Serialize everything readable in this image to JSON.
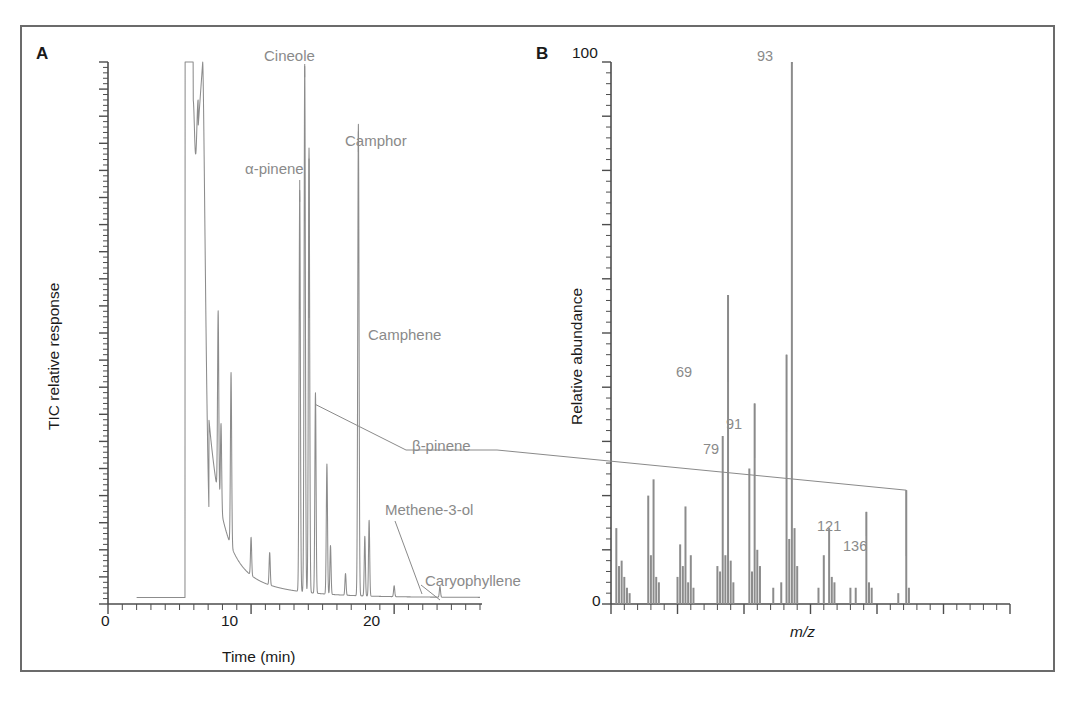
{
  "figure": {
    "background_color": "#ffffff",
    "frame_color": "#6b6b6b",
    "trace_color": "#8c8c8c",
    "axis_color": "#4d4d4d",
    "label_color": "#8a8a8a",
    "text_color": "#1a1a1a"
  },
  "panels": {
    "a": {
      "letter": "A",
      "ylabel": "TIC relative response",
      "xlabel": "Time (min)",
      "xticklabels": [
        "0",
        "10",
        "20"
      ],
      "annotations": [
        {
          "label": "Cineole"
        },
        {
          "label": "α-pinene"
        },
        {
          "label": "Camphor"
        },
        {
          "label": "Camphene"
        },
        {
          "label": "β-pinene"
        },
        {
          "label": "Methene-3-ol"
        },
        {
          "label": "Caryophyllene"
        }
      ]
    },
    "b": {
      "letter": "B",
      "ylabel": "Relative abundance",
      "xlabel": "m/z",
      "yticklabels": [
        "100",
        "0"
      ],
      "annotations": [
        {
          "label": "93"
        },
        {
          "label": "69"
        },
        {
          "label": "91"
        },
        {
          "label": "79"
        },
        {
          "label": "121"
        },
        {
          "label": "136"
        }
      ]
    }
  },
  "chart_data": [
    {
      "type": "line",
      "id": "panel-a-chromatogram",
      "title": "A",
      "xlabel": "Time (min)",
      "ylabel": "TIC relative response",
      "xlim": [
        0,
        26
      ],
      "ylim": [
        0,
        100
      ],
      "grid": false,
      "legend": "none",
      "xticks_major": [
        0,
        10,
        20
      ],
      "xticks_minor_interval": 1,
      "yticks_minor_per_major": 5,
      "ytick_labels_shown": false,
      "baseline_start_time": 2.0,
      "peaks": [
        {
          "name": "solvent front",
          "time": 5.4,
          "height": 100,
          "label": null
        },
        {
          "name": "solvent shoulder",
          "time": 6.1,
          "height": 88,
          "label": null
        },
        {
          "name": "solvent tail peak",
          "time": 6.6,
          "height": 100,
          "label": null
        },
        {
          "name": "unknown 1",
          "time": 7.7,
          "height": 34,
          "label": null
        },
        {
          "name": "unknown 2",
          "time": 7.9,
          "height": 16,
          "label": null
        },
        {
          "name": "unknown 3",
          "time": 8.6,
          "height": 32,
          "label": null
        },
        {
          "name": "unknown 4",
          "time": 10.0,
          "height": 7,
          "label": null
        },
        {
          "name": "unknown 5",
          "time": 11.3,
          "height": 6,
          "label": null
        },
        {
          "name": "alpha-pinene",
          "time": 13.4,
          "height": 74,
          "label": "α-pinene"
        },
        {
          "name": "cineole",
          "time": 13.75,
          "height": 97,
          "label": "Cineole"
        },
        {
          "name": "camphene",
          "time": 14.05,
          "height": 82,
          "label": "Camphene"
        },
        {
          "name": "beta-pinene",
          "time": 14.5,
          "height": 37,
          "label": "β-pinene"
        },
        {
          "name": "unknown 6",
          "time": 15.3,
          "height": 24,
          "label": null
        },
        {
          "name": "unknown 7",
          "time": 15.55,
          "height": 9,
          "label": null
        },
        {
          "name": "unknown 8",
          "time": 16.6,
          "height": 4,
          "label": null
        },
        {
          "name": "camphor",
          "time": 17.5,
          "height": 87,
          "label": "Camphor"
        },
        {
          "name": "unknown 9",
          "time": 17.95,
          "height": 11,
          "label": null
        },
        {
          "name": "unknown 10",
          "time": 18.25,
          "height": 14,
          "label": null
        },
        {
          "name": "methene-3-ol",
          "time": 20.0,
          "height": 2,
          "label": "Methene-3-ol"
        },
        {
          "name": "caryophyllene",
          "time": 23.2,
          "height": 2,
          "label": "Caryophyllene"
        }
      ]
    },
    {
      "type": "bar",
      "id": "panel-b-mass-spectrum",
      "title": "B",
      "xlabel": "m/z",
      "ylabel": "Relative abundance",
      "xlim": [
        25,
        175
      ],
      "ylim": [
        0,
        100
      ],
      "grid": false,
      "legend": "none",
      "yticks_major": [
        0,
        10,
        20,
        30,
        40,
        50,
        60,
        70,
        80,
        90,
        100
      ],
      "ytick_labels_shown": [
        "100",
        "0"
      ],
      "xticks_minor_interval": 5,
      "xticks_major_interval": 25,
      "xtick_labels_shown": false,
      "mz": [
        27,
        28,
        29,
        30,
        31,
        32,
        39,
        40,
        41,
        42,
        43,
        50,
        51,
        52,
        53,
        54,
        55,
        56,
        65,
        66,
        67,
        68,
        69,
        70,
        71,
        77,
        78,
        79,
        80,
        81,
        86,
        89,
        91,
        92,
        93,
        94,
        95,
        103,
        105,
        107,
        108,
        109,
        115,
        117,
        121,
        122,
        123,
        133,
        136,
        137
      ],
      "intensity": [
        14,
        7,
        8,
        5,
        3,
        2,
        20,
        9,
        23,
        5,
        4,
        5,
        11,
        7,
        18,
        4,
        9,
        3,
        7,
        6,
        31,
        9,
        57,
        8,
        4,
        25,
        6,
        37,
        10,
        7,
        3,
        4,
        46,
        12,
        100,
        14,
        7,
        3,
        9,
        14,
        5,
        4,
        3,
        3,
        17,
        4,
        3,
        2,
        21,
        3
      ],
      "labeled_peaks": [
        {
          "mz": 69,
          "intensity": 57,
          "label": "69"
        },
        {
          "mz": 79,
          "intensity": 37,
          "label": "79"
        },
        {
          "mz": 91,
          "intensity": 46,
          "label": "91"
        },
        {
          "mz": 93,
          "intensity": 100,
          "label": "93"
        },
        {
          "mz": 121,
          "intensity": 17,
          "label": "121"
        },
        {
          "mz": 136,
          "intensity": 21,
          "label": "136"
        }
      ]
    }
  ]
}
